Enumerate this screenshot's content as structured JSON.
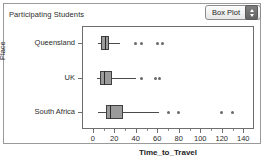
{
  "header": {
    "title": "Participating Students",
    "plot_type_selector": {
      "name": "plot-type-dropdown",
      "selected": "Box Plot",
      "options": [
        "Box Plot"
      ]
    }
  },
  "chart_data": {
    "type": "box",
    "orientation": "horizontal",
    "title": "Participating Students",
    "xlabel": "Time_to_Travel",
    "ylabel": "Place",
    "xlim": [
      -10,
      150
    ],
    "xticks": [
      0,
      20,
      40,
      60,
      80,
      100,
      120,
      140
    ],
    "xtick_labels": [
      "0",
      "20",
      "40",
      "60",
      "80",
      "100",
      "120",
      "140"
    ],
    "grid": false,
    "legend": "none",
    "categories": [
      "Queensland",
      "UK",
      "South Africa"
    ],
    "boxes": [
      {
        "category": "Queensland",
        "whisker_low": 5,
        "q1": 8,
        "median": 11,
        "q3": 15,
        "whisker_high": 25,
        "outliers": [
          40,
          45,
          60,
          65
        ]
      },
      {
        "category": "UK",
        "whisker_low": 4,
        "q1": 7,
        "median": 10,
        "q3": 18,
        "whisker_high": 40,
        "outliers": [
          45,
          58,
          62
        ]
      },
      {
        "category": "South Africa",
        "whisker_low": 5,
        "q1": 12,
        "median": 16,
        "q3": 28,
        "whisker_high": 62,
        "outliers": [
          70,
          80,
          120,
          130
        ]
      }
    ]
  },
  "colors": {
    "box_fill": "#9b9b9b",
    "box_stroke": "#3f3f3f",
    "median": "#2a2a2a",
    "whisker": "#4a4a4a",
    "outlier": "#6a6a6a",
    "frame": "#6e6e6e",
    "panel_border": "#9a9a9a",
    "text": "#2b2b2b",
    "background": "#ffffff"
  }
}
